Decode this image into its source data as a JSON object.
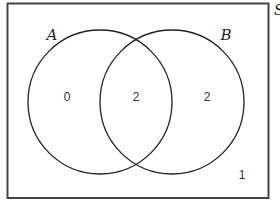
{
  "diagram": {
    "type": "venn",
    "universal_set": {
      "label": "S"
    },
    "sets": [
      {
        "label": "A"
      },
      {
        "label": "B"
      }
    ],
    "regions": {
      "only_a": "0",
      "a_and_b": "2",
      "only_b": "2",
      "outside": "1"
    },
    "colors": {
      "stroke": "#222222",
      "background": "#ffffff"
    }
  }
}
